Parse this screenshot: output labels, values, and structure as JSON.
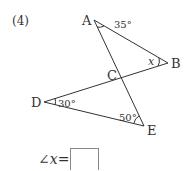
{
  "problem": {
    "number": "(4)",
    "points": {
      "A": "A",
      "B": "B",
      "C": "C",
      "D": "D",
      "E": "E"
    },
    "angles": {
      "A": "35°",
      "B": "x",
      "D": "30°",
      "E": "50°"
    },
    "answer_prefix": "∠x=",
    "answer_value": ""
  }
}
